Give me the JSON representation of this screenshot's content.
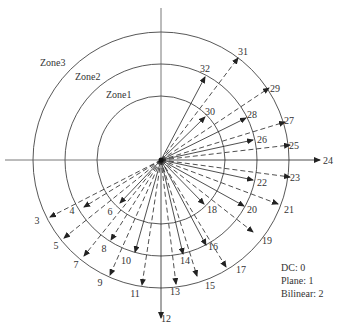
{
  "diagram": {
    "center": [
      161,
      160
    ],
    "zones": [
      {
        "label": "Zone1",
        "radius": 64,
        "label_pos": [
          106,
          98
        ]
      },
      {
        "label": "Zone2",
        "radius": 96,
        "label_pos": [
          75,
          80
        ]
      },
      {
        "label": "Zone3",
        "radius": 128,
        "label_pos": [
          40,
          66
        ]
      }
    ],
    "axes": {
      "h_left": 5,
      "h_right": 320,
      "v_top": 8,
      "v_bottom": 318
    },
    "arrows": [
      {
        "id": "3",
        "tip": [
          50,
          217
        ],
        "dashed": true,
        "label_pos": [
          37,
          224
        ]
      },
      {
        "id": "4",
        "tip": [
          84,
          207
        ],
        "dashed": true,
        "label_pos": [
          72,
          214
        ]
      },
      {
        "id": "5",
        "tip": [
          64,
          238
        ],
        "dashed": true,
        "label_pos": [
          56,
          249
        ]
      },
      {
        "id": "6",
        "tip": [
          120,
          203
        ],
        "dashed": false,
        "label_pos": [
          110,
          215
        ]
      },
      {
        "id": "7",
        "tip": [
          84,
          256
        ],
        "dashed": true,
        "label_pos": [
          76,
          268
        ]
      },
      {
        "id": "8",
        "tip": [
          111,
          240
        ],
        "dashed": true,
        "label_pos": [
          104,
          252
        ]
      },
      {
        "id": "9",
        "tip": [
          110,
          275
        ],
        "dashed": true,
        "label_pos": [
          100,
          286
        ]
      },
      {
        "id": "10",
        "tip": [
          135,
          252
        ],
        "dashed": false,
        "label_pos": [
          126,
          264
        ]
      },
      {
        "id": "11",
        "tip": [
          142,
          285
        ],
        "dashed": true,
        "label_pos": [
          135,
          297
        ]
      },
      {
        "id": "12",
        "tip": [
          161,
          318
        ],
        "dashed": false,
        "label_pos": [
          166,
          322
        ]
      },
      {
        "id": "13",
        "tip": [
          176,
          284
        ],
        "dashed": true,
        "label_pos": [
          175,
          295
        ]
      },
      {
        "id": "14",
        "tip": [
          183,
          254
        ],
        "dashed": false,
        "label_pos": [
          185,
          264
        ]
      },
      {
        "id": "15",
        "tip": [
          197,
          276
        ],
        "dashed": true,
        "label_pos": [
          210,
          289
        ]
      },
      {
        "id": "16",
        "tip": [
          206,
          245
        ],
        "dashed": false,
        "label_pos": [
          213,
          250
        ]
      },
      {
        "id": "17",
        "tip": [
          226,
          267
        ],
        "dashed": true,
        "label_pos": [
          241,
          273
        ]
      },
      {
        "id": "18",
        "tip": [
          204,
          204
        ],
        "dashed": false,
        "label_pos": [
          212,
          213
        ]
      },
      {
        "id": "19",
        "tip": [
          253,
          232
        ],
        "dashed": true,
        "label_pos": [
          267,
          244
        ]
      },
      {
        "id": "20",
        "tip": [
          244,
          206
        ],
        "dashed": false,
        "label_pos": [
          252,
          213
        ]
      },
      {
        "id": "21",
        "tip": [
          278,
          204
        ],
        "dashed": true,
        "label_pos": [
          289,
          213
        ]
      },
      {
        "id": "22",
        "tip": [
          253,
          180
        ],
        "dashed": false,
        "label_pos": [
          262,
          186
        ]
      },
      {
        "id": "23",
        "tip": [
          290,
          177
        ],
        "dashed": true,
        "label_pos": [
          295,
          181
        ]
      },
      {
        "id": "24",
        "tip": [
          320,
          160
        ],
        "dashed": false,
        "label_pos": [
          328,
          164
        ]
      },
      {
        "id": "25",
        "tip": [
          290,
          145
        ],
        "dashed": true,
        "label_pos": [
          294,
          149
        ]
      },
      {
        "id": "26",
        "tip": [
          253,
          140
        ],
        "dashed": false,
        "label_pos": [
          262,
          143
        ]
      },
      {
        "id": "27",
        "tip": [
          285,
          122
        ],
        "dashed": true,
        "label_pos": [
          289,
          124
        ]
      },
      {
        "id": "28",
        "tip": [
          246,
          118
        ],
        "dashed": false,
        "label_pos": [
          252,
          118
        ]
      },
      {
        "id": "29",
        "tip": [
          269,
          88
        ],
        "dashed": true,
        "label_pos": [
          275,
          92
        ]
      },
      {
        "id": "30",
        "tip": [
          205,
          117
        ],
        "dashed": false,
        "label_pos": [
          210,
          115
        ]
      },
      {
        "id": "31",
        "tip": [
          238,
          58
        ],
        "dashed": true,
        "label_pos": [
          243,
          55
        ]
      },
      {
        "id": "32",
        "tip": [
          205,
          77
        ],
        "dashed": false,
        "label_pos": [
          205,
          72
        ]
      }
    ]
  },
  "legend": {
    "lines": [
      "DC: 0",
      "Plane: 1",
      "Bilinear: 2"
    ]
  }
}
